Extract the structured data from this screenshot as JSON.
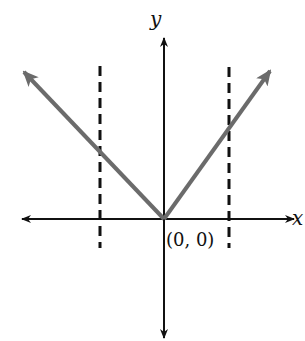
{
  "axes": {
    "x_label": "x",
    "y_label": "y",
    "origin_label": "(0, 0)"
  },
  "colors": {
    "axis": "#111111",
    "curve": "#6b6b6b",
    "dashed": "#111111"
  },
  "geometry": {
    "origin": [
      164,
      219
    ],
    "x_axis": {
      "from": 20,
      "to": 296
    },
    "y_axis": {
      "from": 36,
      "to": 340
    },
    "left_ray_tip": [
      22,
      70
    ],
    "right_ray_tip": [
      272,
      69
    ],
    "dashed_left": {
      "x": 100,
      "y1": 66,
      "y2": 248
    },
    "dashed_right": {
      "x": 229,
      "y1": 67,
      "y2": 248
    }
  }
}
